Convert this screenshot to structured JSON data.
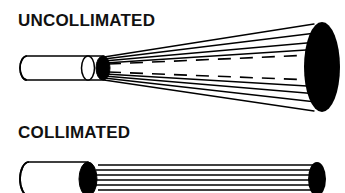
{
  "figure": {
    "title_visible": false,
    "background_color": "#ffffff",
    "ink_color": "#000000",
    "panels": [
      {
        "id": "uncollimated",
        "label": "UNCOLLIMATED",
        "label_x": 18,
        "label_y": 26,
        "source_tube": {
          "name": "collimator-tube",
          "x": 20,
          "y": 55,
          "length": 88,
          "radius_y": 12,
          "radius_x": 7,
          "fill": "#ffffff",
          "stroke": "#000000"
        },
        "aperture": {
          "name": "aperture-ellipse",
          "cx": 104,
          "cy": 68,
          "rx": 7,
          "ry": 12,
          "fill": "#000000"
        },
        "beam": {
          "type": "diverging-cone",
          "apex_x": 104,
          "apex_y": 68,
          "end_x": 322,
          "end_cy": 67,
          "end_rx": 18,
          "end_ry": 45,
          "solid_ray_count": 8,
          "dashed_ray_count": 2,
          "stroke": "#000000"
        },
        "target": {
          "name": "beam-spot-ellipse",
          "cx": 322,
          "cy": 67,
          "rx": 18,
          "ry": 45,
          "fill": "#000000"
        }
      },
      {
        "id": "collimated",
        "label": "COLLIMATED",
        "label_x": 18,
        "label_y": 138,
        "source_tube": {
          "name": "collimator-tube",
          "x": 20,
          "y": 162,
          "length": 68,
          "radius_y": 17,
          "radius_x": 9,
          "fill": "#ffffff",
          "stroke": "#000000"
        },
        "aperture": {
          "name": "aperture-ellipse",
          "cx": 88,
          "cy": 179,
          "rx": 9,
          "ry": 17,
          "fill": "#000000"
        },
        "beam": {
          "type": "parallel-rays",
          "start_x": 98,
          "end_x": 312,
          "ray_count": 7,
          "top_y": 164,
          "bottom_y": 194,
          "stroke": "#000000"
        },
        "target": {
          "name": "beam-spot-ellipse",
          "cx": 317,
          "cy": 179,
          "rx": 9,
          "ry": 17,
          "fill": "#000000"
        }
      }
    ]
  }
}
